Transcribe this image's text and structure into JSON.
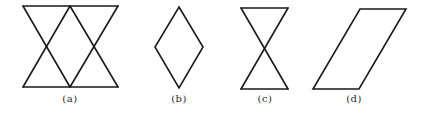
{
  "figure": {
    "background": "#ffffff",
    "stroke_color": "#1a1a1a",
    "panels": [
      {
        "id": "a",
        "label": "(a)",
        "description": "two overlapping triangles forming a band: top edge, bottom edge, with two X crossings",
        "label_x": 70,
        "shape_type": "double-hourglass",
        "points": "23,6 118,6 70,6 23,87 118,87 70,87"
      },
      {
        "id": "b",
        "label": "(b)",
        "description": "rhombus / diamond",
        "label_x": 179,
        "shape_type": "rhombus",
        "points": "179,7 203,47 179,88 155,47"
      },
      {
        "id": "c",
        "label": "(c)",
        "description": "hourglass / bowtie of two triangles meeting at a point",
        "label_x": 265,
        "shape_type": "hourglass",
        "points": "241,8 288,8 241,89 288,89"
      },
      {
        "id": "d",
        "label": "(d)",
        "description": "parallelogram slanted to the right",
        "label_x": 354,
        "shape_type": "parallelogram",
        "points": "360,9 406,9 359,89 313,89"
      }
    ]
  }
}
